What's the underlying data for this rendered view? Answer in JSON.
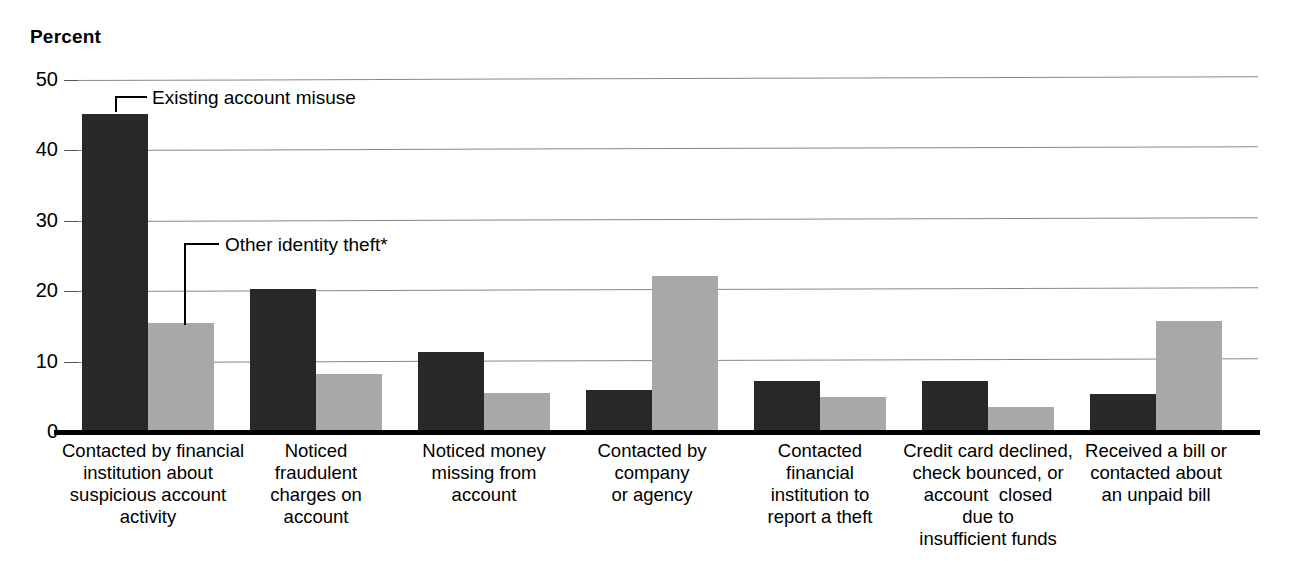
{
  "chart_data": {
    "type": "bar",
    "title": "",
    "ylabel": "Percent",
    "xlabel": "",
    "ylim": [
      0,
      50
    ],
    "yticks": [
      0,
      10,
      20,
      30,
      40,
      50
    ],
    "grid": true,
    "legend_position": "annotations-on-bars",
    "categories": [
      "Contacted by financial institution about suspicious account activity",
      "Noticed fraudulent charges on account",
      "Noticed money missing from account",
      "Contacted by company or agency",
      "Contacted financial institution to report a theft",
      "Credit card declined, check bounced, or account  closed due to insufficient funds",
      "Received a bill or contacted about an unpaid bill"
    ],
    "category_lines": [
      [
        "Contacted by financial",
        "institution about",
        "suspicious account",
        "activity"
      ],
      [
        "Noticed",
        "fraudulent",
        "charges on",
        "account"
      ],
      [
        "Noticed money",
        "missing from",
        "account"
      ],
      [
        "Contacted by",
        "company",
        "or agency"
      ],
      [
        "Contacted",
        "financial",
        "institution to",
        "report a theft"
      ],
      [
        "Credit card declined,",
        "check bounced, or",
        "account  closed",
        "due to",
        "insufficient funds"
      ],
      [
        "Received a bill or",
        "contacted about",
        "an unpaid bill"
      ]
    ],
    "series": [
      {
        "name": "Existing account misuse",
        "color": "#282828",
        "values": [
          45.2,
          20.3,
          11.3,
          5.9,
          7.2,
          7.2,
          5.4
        ]
      },
      {
        "name": "Other identity theft*",
        "color": "#a8a8a8",
        "values": [
          15.5,
          8.2,
          5.6,
          22.2,
          5.0,
          3.5,
          15.8
        ]
      }
    ],
    "annotations": [
      {
        "text": "Existing account misuse",
        "series": "Existing account misuse",
        "points_to_category_index": 0
      },
      {
        "text": "Other identity theft*",
        "series": "Other identity theft*",
        "points_to_category_index": 0
      }
    ]
  },
  "axis": {
    "y_title": "Percent",
    "tick_labels": [
      "50",
      "40",
      "30",
      "20",
      "10",
      "0"
    ]
  },
  "colors": {
    "series_dark": "#282828",
    "series_light": "#a8a8a8",
    "gridline": "#8a8a8a",
    "baseline": "#000000",
    "background": "#ffffff"
  }
}
